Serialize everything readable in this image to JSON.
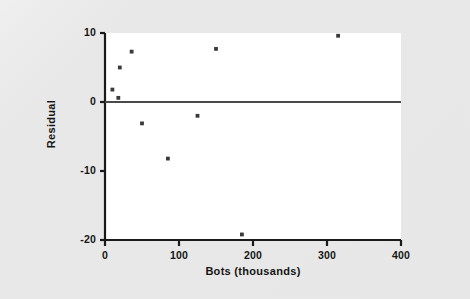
{
  "chart_data": {
    "type": "scatter",
    "title": "",
    "xlabel": "Bots (thousands)",
    "ylabel": "Residual",
    "xlim": [
      0,
      400
    ],
    "ylim": [
      -20,
      10
    ],
    "xticks": [
      "0",
      "100",
      "200",
      "300",
      "400"
    ],
    "xtick_values": [
      0,
      100,
      200,
      300,
      400
    ],
    "yticks": [
      "10",
      "0",
      "-10",
      "-20"
    ],
    "ytick_values": [
      10,
      0,
      -10,
      -20
    ],
    "grid": false,
    "legend": false,
    "reference_line": {
      "axis": "y",
      "value": 0
    },
    "points": [
      {
        "x": 10,
        "y": 1.8
      },
      {
        "x": 18,
        "y": 0.6
      },
      {
        "x": 20,
        "y": 5.0
      },
      {
        "x": 36,
        "y": 7.3
      },
      {
        "x": 50,
        "y": -3.1
      },
      {
        "x": 85,
        "y": -8.2
      },
      {
        "x": 125,
        "y": -2.0
      },
      {
        "x": 150,
        "y": 7.7
      },
      {
        "x": 185,
        "y": -19.2
      },
      {
        "x": 315,
        "y": 9.6
      }
    ],
    "colors": {
      "point": "#3a3a3a",
      "axis": "#1a1a1a",
      "reference_line": "#4a4a4a",
      "plot_background": "#ffffff",
      "figure_background": "#e8e8e8",
      "text": "#151515"
    }
  }
}
